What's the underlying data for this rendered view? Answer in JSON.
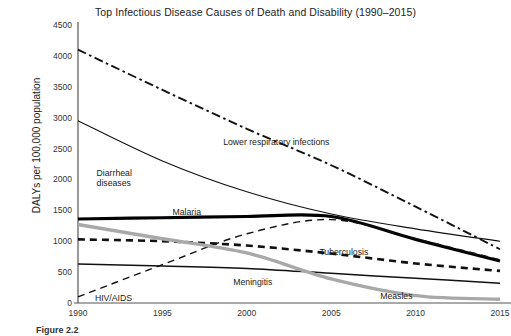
{
  "chart_data": {
    "type": "line",
    "title": "Top Infectious Disease Causes of Death and Disability (1990–2015)",
    "xlabel": "",
    "ylabel": "DALYs per 100,000 population",
    "x": [
      1990,
      1995,
      2000,
      2005,
      2010,
      2015
    ],
    "xtick_labels": [
      "1990",
      "1995",
      "2000",
      "2005",
      "2010",
      "2015"
    ],
    "ytick_labels": [
      "0",
      "500",
      "1000",
      "1500",
      "2000",
      "2500",
      "3000",
      "3500",
      "4000",
      "4500"
    ],
    "ytick_values": [
      0,
      500,
      1000,
      1500,
      2000,
      2500,
      3000,
      3500,
      4000,
      4500
    ],
    "ylim": [
      0,
      4500
    ],
    "xlim": [
      1990,
      2015
    ],
    "grid": false,
    "legend": "inline-labels",
    "series": [
      {
        "name": "Lower respiratory infections",
        "style": "dash-dot",
        "color": "#111111",
        "width": 1.9,
        "values": [
          4100,
          3450,
          2820,
          2230,
          1560,
          870
        ],
        "label_x": 1998.6,
        "label_y": 2680
      },
      {
        "name": "Diarrheal diseases",
        "style": "solid",
        "color": "#111111",
        "width": 1.1,
        "values": [
          2950,
          2300,
          1800,
          1440,
          1200,
          1000
        ],
        "label_x": 1991.1,
        "label_y": 2190
      },
      {
        "name": "Malaria",
        "style": "solid",
        "color": "#000000",
        "width": 3.2,
        "values": [
          1360,
          1380,
          1400,
          1400,
          1030,
          680
        ],
        "label_x": 1995.6,
        "label_y": 1560
      },
      {
        "name": "Tuberculosis",
        "style": "dashed",
        "color": "#111111",
        "width": 2.6,
        "values": [
          1030,
          1000,
          930,
          800,
          640,
          520
        ],
        "label_x": 2004.3,
        "label_y": 910
      },
      {
        "name": "HIV/AIDS",
        "style": "dashed",
        "color": "#111111",
        "width": 1.4,
        "values": [
          100,
          620,
          1120,
          1350,
          1040,
          700
        ],
        "label_x": 1991.0,
        "label_y": 160
      },
      {
        "name": "Meningitis",
        "style": "solid",
        "color": "#111111",
        "width": 1.5,
        "values": [
          630,
          600,
          560,
          480,
          400,
          320
        ],
        "label_x": 1999.2,
        "label_y": 420
      },
      {
        "name": "Measles",
        "style": "solid",
        "color": "#a8a8a8",
        "width": 3.4,
        "values": [
          1270,
          1040,
          810,
          390,
          120,
          60
        ],
        "label_x": 2007.9,
        "label_y": 190
      }
    ]
  },
  "caption": "Figure 2.2"
}
